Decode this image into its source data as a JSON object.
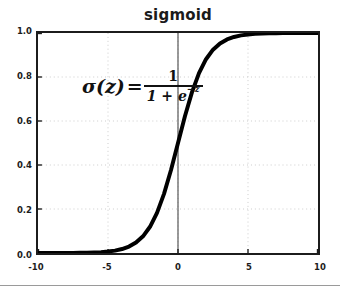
{
  "chart_data": {
    "type": "line",
    "title": "sigmoid",
    "xlabel": "",
    "ylabel": "",
    "xlim": [
      -10,
      10
    ],
    "ylim": [
      0.0,
      1.0
    ],
    "grid": true,
    "grid_style": "dotted",
    "legend": null,
    "xticks": [
      "-10",
      "-5",
      "0",
      "5",
      "10"
    ],
    "xtick_values": [
      -10,
      -5,
      0,
      5,
      10
    ],
    "yticks": [
      "0.0",
      "0.2",
      "0.4",
      "0.6",
      "0.8",
      "1.0"
    ],
    "ytick_values": [
      0.0,
      0.2,
      0.4,
      0.6,
      0.8,
      1.0
    ],
    "series": [
      {
        "name": "sigmoid",
        "color": "#000000",
        "linewidth": 4,
        "x": [
          -10,
          -9.5,
          -9,
          -8.5,
          -8,
          -7.5,
          -7,
          -6.5,
          -6,
          -5.5,
          -5,
          -4.5,
          -4,
          -3.5,
          -3,
          -2.5,
          -2,
          -1.5,
          -1,
          -0.5,
          0,
          0.5,
          1,
          1.5,
          2,
          2.5,
          3,
          3.5,
          4,
          4.5,
          5,
          5.5,
          6,
          6.5,
          7,
          7.5,
          8,
          8.5,
          9,
          9.5,
          10
        ],
        "y": [
          4.54e-05,
          7.49e-05,
          0.0001234,
          0.0002035,
          0.0003354,
          0.0005527,
          0.000911,
          0.0015012,
          0.0024726,
          0.0040702,
          0.0066929,
          0.0109869,
          0.0179862,
          0.0293122,
          0.0474259,
          0.0758582,
          0.1192029,
          0.1824255,
          0.2689414,
          0.3775407,
          0.5,
          0.6224593,
          0.7310586,
          0.8175745,
          0.8807971,
          0.9241418,
          0.9525741,
          0.9706878,
          0.9820138,
          0.9890131,
          0.9933071,
          0.9959298,
          0.9975274,
          0.9984988,
          0.9990889,
          0.9994473,
          0.9996646,
          0.9997965,
          0.9998766,
          0.9999251,
          0.9999546
        ]
      }
    ],
    "annotations": [
      {
        "name": "sigmoid-formula",
        "lhs": "σ(z)",
        "equals": "=",
        "numerator": "1",
        "denominator_prefix": "1 + e",
        "denominator_exponent": "−z",
        "text": "σ(z) = 1 / (1 + e^{−z})"
      }
    ],
    "axis_lines": [
      {
        "name": "zero-vertical-line",
        "x": 0,
        "color": "#555555"
      }
    ],
    "colors": {
      "curve": "#000000",
      "frame": "#1c1c1c",
      "grid": "#cccccc",
      "zero_line": "#555555",
      "background": "#ffffff",
      "divider": "#9a9a9a",
      "text": "#1c1c1c"
    }
  }
}
